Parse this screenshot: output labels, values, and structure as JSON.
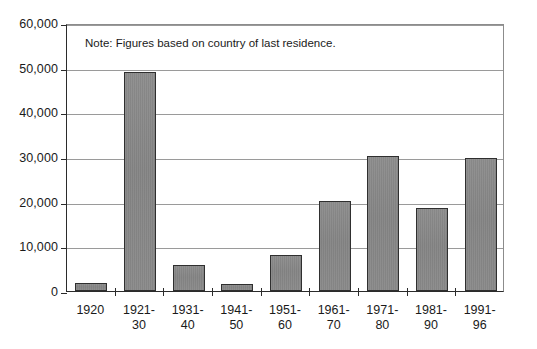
{
  "chart_data": {
    "type": "bar",
    "title": "",
    "subtitle": "",
    "xlabel": "",
    "ylabel": "",
    "note": "Note: Figures based on country of last residence.",
    "categories": [
      "1920",
      "1921-30",
      "1931-40",
      "1941-50",
      "1951-60",
      "1961-70",
      "1971-80",
      "1981-90",
      "1991-96"
    ],
    "category_lines": [
      [
        "1920",
        ""
      ],
      [
        "1921-",
        "30"
      ],
      [
        "1931-",
        "40"
      ],
      [
        "1941-",
        "50"
      ],
      [
        "1951-",
        "60"
      ],
      [
        "1961-",
        "70"
      ],
      [
        "1971-",
        "80"
      ],
      [
        "1981-",
        "90"
      ],
      [
        "1991-",
        "96"
      ]
    ],
    "values": [
      1800,
      49000,
      5800,
      1500,
      8000,
      20200,
      30300,
      18500,
      29800
    ],
    "ylim": [
      0,
      60000
    ],
    "ytick_values": [
      60000,
      50000,
      40000,
      30000,
      20000,
      10000,
      0
    ],
    "ytick_labels": [
      "60,000",
      "50,000",
      "40,000",
      "30,000",
      "20,000",
      "10,000",
      "0"
    ],
    "grid": true,
    "grid_axis": "y",
    "legend": false,
    "legend_position": "none",
    "bar_fill_color": "#898989",
    "bar_edge_color": "#2f2f2f",
    "gridline_color": "#9a9a9a",
    "axis_color": "#2b2b2b",
    "background_color": "#ffffff"
  }
}
